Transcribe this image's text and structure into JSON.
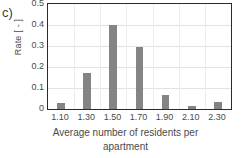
{
  "panel": {
    "label": "c)"
  },
  "chart_data": {
    "type": "bar",
    "title": "",
    "subtitle": "",
    "xlabel": "Average number of residents per apartment",
    "xlabel_line1": "Average number of residents per",
    "xlabel_line2": "apartment",
    "ylabel": "Rate [ - ]",
    "categories": [
      "1.10",
      "1.30",
      "1.50",
      "1.70",
      "1.90",
      "2.10",
      "2.30"
    ],
    "values": [
      0.03,
      0.17,
      0.4,
      0.295,
      0.065,
      0.015,
      0.035
    ],
    "ylim": [
      0,
      0.5
    ],
    "yticks": [
      "0",
      "0.1",
      "0.2",
      "0.3",
      "0.4",
      "0.5"
    ],
    "ytick_values": [
      0,
      0.1,
      0.2,
      0.3,
      0.4,
      0.5
    ],
    "grid": "horizontal",
    "legend": "none",
    "bar_color": "#848484",
    "grid_color": "#e2e2e2",
    "axis_color": "#2b2b2b",
    "text_color": "#4a4a4a"
  }
}
